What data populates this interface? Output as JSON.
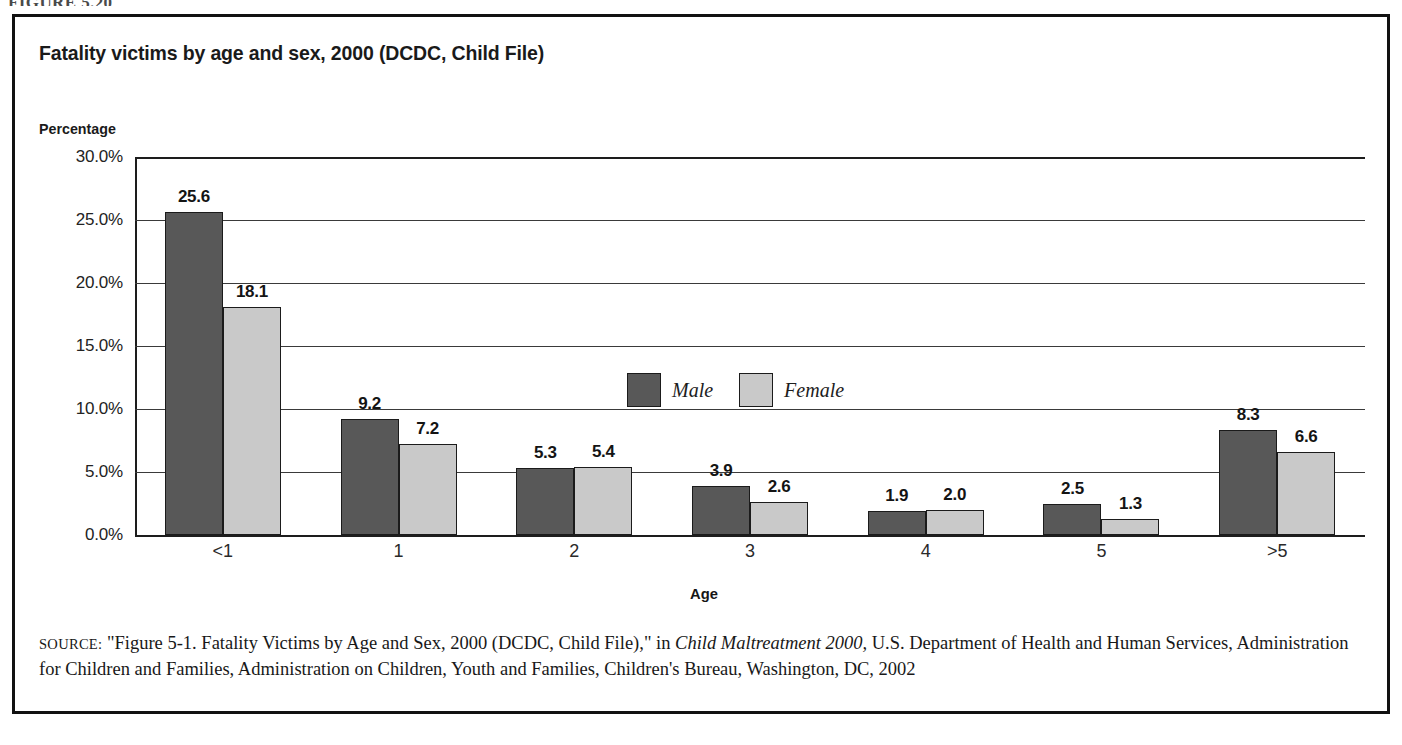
{
  "figure_caption": "FIGURE 5.20",
  "chart": {
    "title": "Fatality victims by age and sex, 2000 (DCDC, Child File)",
    "y_axis_title": "Percentage",
    "x_axis_title": "Age"
  },
  "legend": {
    "items": [
      {
        "label": "Male",
        "color": "#585858",
        "swatch": "male-swatch"
      },
      {
        "label": "Female",
        "color": "#c9c9c9",
        "swatch": "female-swatch"
      }
    ]
  },
  "source": {
    "label": "SOURCE:",
    "text_part_1": " \"Figure 5-1. Fatality Victims by Age and Sex, 2000 (DCDC, Child File),\" in ",
    "italic_title": "Child Maltreatment 2000,",
    "text_part_2": " U.S. Department of Health and Human Services, Administration for Children and Families, Administration on Children, Youth and Families, Children's Bureau, Washington, DC, 2002"
  },
  "chart_data": {
    "type": "bar",
    "title": "Fatality victims by age and sex, 2000 (DCDC, Child File)",
    "xlabel": "Age",
    "ylabel": "Percentage",
    "ylim": [
      0,
      30
    ],
    "ytick_labels": [
      "0.0%",
      "5.0%",
      "10.0%",
      "15.0%",
      "20.0%",
      "25.0%",
      "30.0%"
    ],
    "ytick_values": [
      0,
      5,
      10,
      15,
      20,
      25,
      30
    ],
    "grid": true,
    "legend_position": "upper-center-inside",
    "value_labels": true,
    "unit": "percent",
    "categories": [
      "<1",
      "1",
      "2",
      "3",
      "4",
      "5",
      ">5"
    ],
    "series": [
      {
        "name": "Male",
        "color": "#585858",
        "values": [
          25.6,
          9.2,
          5.3,
          3.9,
          1.9,
          2.5,
          8.3
        ],
        "labels": [
          "25.6",
          "9.2",
          "5.3",
          "3.9",
          "1.9",
          "2.5",
          "8.3"
        ]
      },
      {
        "name": "Female",
        "color": "#c9c9c9",
        "values": [
          18.1,
          7.2,
          5.4,
          2.6,
          2.0,
          1.3,
          6.6
        ],
        "labels": [
          "18.1",
          "7.2",
          "5.4",
          "2.6",
          "2.0",
          "1.3",
          "6.6"
        ]
      }
    ]
  }
}
